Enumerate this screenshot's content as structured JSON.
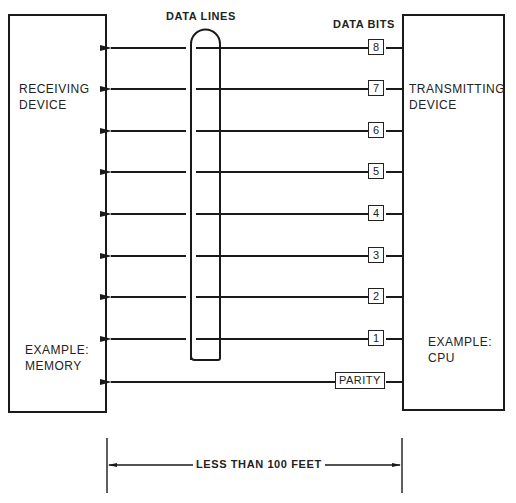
{
  "diagram": {
    "title_data_lines": "DATA LINES",
    "title_data_bits": "DATA BITS",
    "receiver": {
      "line1": "RECEIVING",
      "line2": "DEVICE",
      "example1": "EXAMPLE:",
      "example2": "MEMORY"
    },
    "transmitter": {
      "line1": "TRANSMITTING",
      "line2": "DEVICE",
      "example1": "EXAMPLE:",
      "example2": "CPU"
    },
    "bits": [
      "8",
      "7",
      "6",
      "5",
      "4",
      "3",
      "2",
      "1"
    ],
    "parity_label": "PARITY",
    "distance_label": "LESS THAN 100 FEET",
    "colors": {
      "ink": "#1a1a1a",
      "background": "#ffffff"
    }
  }
}
